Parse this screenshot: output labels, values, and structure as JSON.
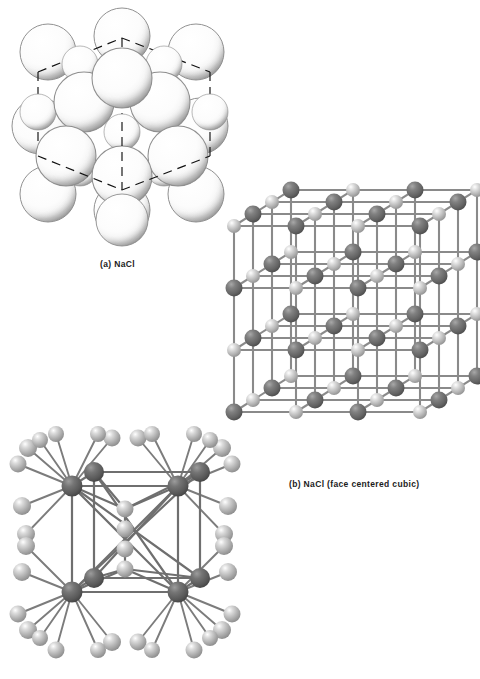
{
  "figure": {
    "background_color": "#ffffff",
    "panels": [
      {
        "id": "a",
        "label": "(a)  NaCl",
        "label_prefix": "(a)",
        "compound": "NaCl",
        "model_type": "space-filling",
        "description": "Space-filling model of sodium chloride with dashed unit-cell cube outline",
        "sphere_color": "#fdfdfd",
        "sphere_outline_color": "#8e8e8e",
        "stipple_color": "#9a9a9a",
        "cell_outline_color": "#111111",
        "cell_outline_style": "dashed"
      },
      {
        "id": "b",
        "label": "(b)  NaCl (face centered cubic)",
        "label_prefix": "(b)",
        "compound": "NaCl",
        "lattice_name": "face centered cubic",
        "model_type": "ball-and-stick",
        "description": "Ball and stick face centered cubic lattice of NaCl, 4x4x4 alternating ions",
        "anion_color": "#6b6b6b",
        "cation_color": "#b5b5b5",
        "bond_color": "#8a8a8a",
        "grid_dimension": 4
      },
      {
        "id": "c",
        "label": "",
        "label_prefix": "",
        "compound": "NaCl",
        "model_type": "coordination",
        "description": "Coordination model showing central cube of ions with outward bonds to surrounding ions",
        "anion_color": "#5e5e5e",
        "cation_color": "#a9a9a9",
        "bond_color": "#7c7c7c"
      }
    ],
    "colors": {
      "ink": "#1c1c1c",
      "paper": "#ffffff",
      "dark_ion": "#6b6b6b",
      "light_ion": "#b5b5b5",
      "bond": "#8a8a8a"
    }
  }
}
